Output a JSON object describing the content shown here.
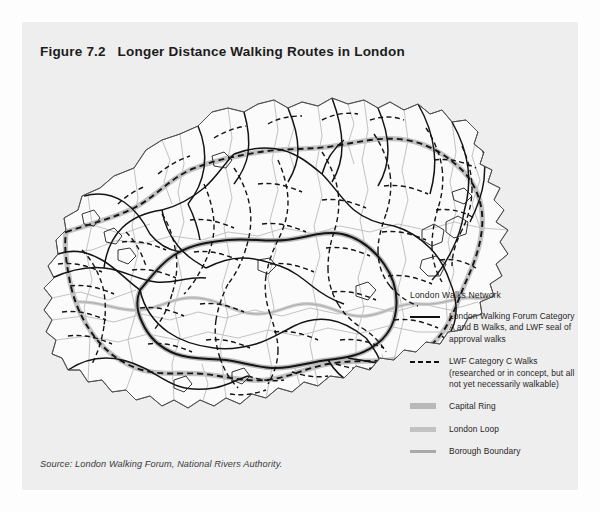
{
  "figure": {
    "title": "Figure 7.2   Longer Distance Walking Routes in London",
    "source": "Source: London Walking Forum, National Rivers Authority."
  },
  "legend": {
    "heading": "London Walks Network",
    "items": [
      {
        "symbol": "solid-line",
        "line1": "London Walking Forum Category",
        "line2": "A and B Walks, and LWF seal of",
        "line3": "approval walks"
      },
      {
        "symbol": "dashed-line",
        "line1": "LWF Category C Walks",
        "line2": "(researched or in concept, but all",
        "line3": "not yet necessarily walkable)"
      },
      {
        "symbol": "grey-band-thick",
        "line1": "Capital Ring",
        "line2": "",
        "line3": ""
      },
      {
        "symbol": "grey-band-medium",
        "line1": "London Loop",
        "line2": "",
        "line3": ""
      },
      {
        "symbol": "grey-line-thin",
        "line1": "Borough Boundary",
        "line2": "",
        "line3": ""
      }
    ]
  },
  "map": {
    "region": "Greater London",
    "panel_background": "#eeeeee",
    "land_fill": "#fbfbfb",
    "borough_boundary_color": "#b0b0b0",
    "route_color": "#111111",
    "capital_ring_halo": "#b9b9b9",
    "london_loop_halo": "#c2c2c2",
    "thames_color": "#c8c8c8"
  }
}
